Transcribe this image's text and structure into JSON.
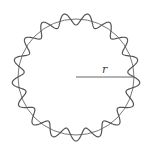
{
  "diagram": {
    "radius_label": "r",
    "circle": {
      "cx": 76,
      "cy": 77,
      "r": 58
    },
    "wave": {
      "wavelengths": 17,
      "amplitude": 6
    },
    "colors": {
      "line": "#555555",
      "background": "#ffffff"
    }
  }
}
